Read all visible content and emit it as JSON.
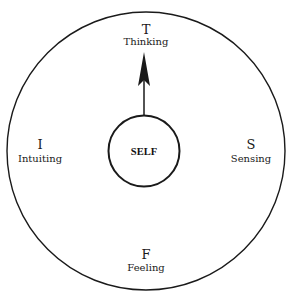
{
  "diagram": {
    "center_label": "SELF",
    "functions": [
      {
        "position": "top",
        "letter": "T",
        "name": "Thinking"
      },
      {
        "position": "right",
        "letter": "S",
        "name": "Sensing"
      },
      {
        "position": "bottom",
        "letter": "F",
        "name": "Feeling"
      },
      {
        "position": "left",
        "letter": "I",
        "name": "Intuiting"
      }
    ],
    "arrow": {
      "from": "SELF",
      "to": "Thinking",
      "direction": "up"
    },
    "colors": {
      "stroke": "#1a1a1a",
      "background": "#ffffff"
    }
  }
}
